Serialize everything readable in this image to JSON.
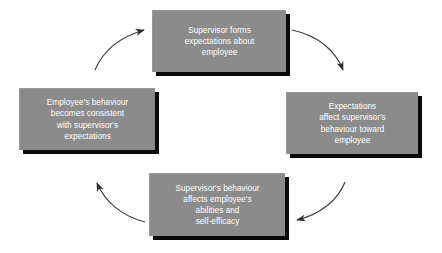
{
  "diagram": {
    "type": "cyclical-flow",
    "background_color": "#ffffff",
    "node_fill_color": "#8b8b8b",
    "node_text_color": "#ffffff",
    "node_shadow_color": "#0a0a0a",
    "arrow_color": "#333333",
    "flow_direction": "clockwise",
    "nodes": [
      {
        "id": "top",
        "position": "top",
        "text": "Supervisor forms\nexpectations about\nemployee",
        "lines": [
          "Supervisor forms",
          "expectations about",
          "employee"
        ]
      },
      {
        "id": "right",
        "position": "right",
        "text": "Expectations\naffect supervisor's\nbehaviour toward\nemployee",
        "lines": [
          "Expectations",
          "affect supervisor's",
          "behaviour toward",
          "employee"
        ]
      },
      {
        "id": "bottom",
        "position": "bottom",
        "text": "Supervisor's behaviour\naffects employee's\nabilities and\nself-efficacy",
        "lines": [
          "Supervisor's behaviour",
          "affects employee's",
          "abilities and",
          "self-efficacy"
        ]
      },
      {
        "id": "left",
        "position": "left",
        "text": "Employee's behaviour\nbecomes consistent\nwith supervisor's\nexpectations",
        "lines": [
          "Employee's behaviour",
          "becomes consistent",
          "with supervisor's",
          "expectations"
        ]
      }
    ],
    "arrows": [
      {
        "id": "top-to-right",
        "from": "top",
        "to": "right",
        "label": ""
      },
      {
        "id": "right-to-bottom",
        "from": "right",
        "to": "bottom",
        "label": ""
      },
      {
        "id": "bottom-to-left",
        "from": "bottom",
        "to": "left",
        "label": ""
      },
      {
        "id": "left-to-top",
        "from": "left",
        "to": "top",
        "label": ""
      }
    ]
  }
}
